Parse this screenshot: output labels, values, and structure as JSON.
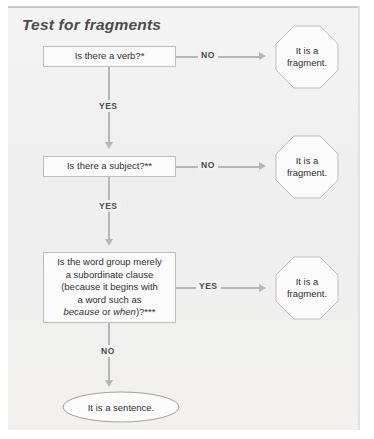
{
  "figure": {
    "title": "Test for fragments",
    "colors": {
      "panel_background": "#f2f2f2",
      "panel_top_rule": "#c9c9c9",
      "shape_fill": "#fbfbfb",
      "shape_border": "#bdbdbd",
      "connector": "#b6b6b6",
      "text": "#2f2f2f",
      "title_text": "#4b4b4b"
    }
  },
  "nodes": {
    "question1": {
      "text": "Is there a verb?*"
    },
    "question2": {
      "text": "Is there a subject?**"
    },
    "question3": {
      "line1": "Is the word group merely",
      "line2": "a subordinate clause",
      "line3": "(because it begins with",
      "line4": "a word such as",
      "line5_italic1": "because",
      "line5_mid": " or ",
      "line5_italic2": "when",
      "line5_end": ")?***"
    },
    "fragment1": {
      "line1": "It is a",
      "line2": "fragment."
    },
    "fragment2": {
      "line1": "It is a",
      "line2": "fragment."
    },
    "fragment3": {
      "line1": "It is a",
      "line2": "fragment."
    },
    "sentence": {
      "text": "It is a sentence."
    }
  },
  "edges": {
    "q1_no": "NO",
    "q1_yes": "YES",
    "q2_no": "NO",
    "q2_yes": "YES",
    "q3_yes": "YES",
    "q3_no": "NO"
  }
}
